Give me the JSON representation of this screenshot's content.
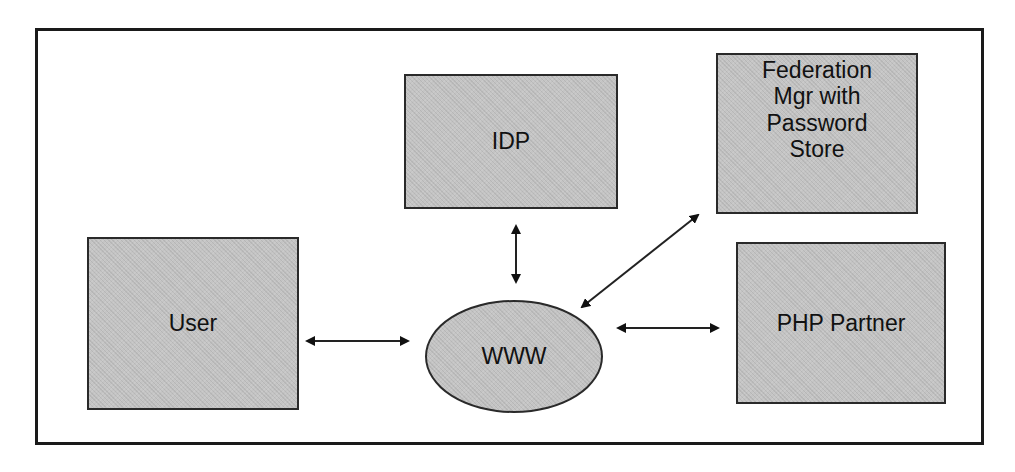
{
  "diagram": {
    "nodes": {
      "idp": {
        "label": "IDP"
      },
      "federation": {
        "label": "Federation\nMgr with\nPassword\nStore"
      },
      "user": {
        "label": "User"
      },
      "php_partner": {
        "label": "PHP Partner"
      },
      "www": {
        "label": "WWW"
      }
    },
    "edges": [
      {
        "from": "user",
        "to": "www",
        "direction": "bidirectional"
      },
      {
        "from": "idp",
        "to": "www",
        "direction": "bidirectional"
      },
      {
        "from": "federation",
        "to": "www",
        "direction": "bidirectional"
      },
      {
        "from": "www",
        "to": "php_partner",
        "direction": "bidirectional"
      }
    ],
    "colors": {
      "node_fill": "#c4c4c4",
      "stroke": "#1a1a1a",
      "background": "#ffffff"
    }
  }
}
